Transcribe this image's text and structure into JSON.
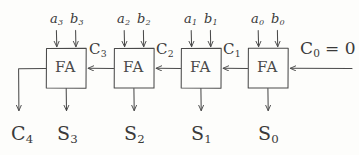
{
  "diagram": {
    "stroke_color": "#4a4a4a",
    "background_color": "#fdfdfb",
    "block_label": "FA",
    "blocks": [
      {
        "name": "fa-3",
        "label": "FA",
        "x": 46,
        "y": 48,
        "w": 40,
        "h": 40
      },
      {
        "name": "fa-2",
        "label": "FA",
        "x": 114,
        "y": 48,
        "w": 40,
        "h": 40
      },
      {
        "name": "fa-1",
        "label": "FA",
        "x": 181,
        "y": 48,
        "w": 40,
        "h": 40
      },
      {
        "name": "fa-0",
        "label": "FA",
        "x": 248,
        "y": 48,
        "w": 40,
        "h": 40
      }
    ],
    "inputs": [
      {
        "name": "input-a3",
        "letter": "a",
        "index": "3",
        "x": 50,
        "y": 12
      },
      {
        "name": "input-b3",
        "letter": "b",
        "index": "3",
        "x": 70,
        "y": 12
      },
      {
        "name": "input-a2",
        "letter": "a",
        "index": "2",
        "x": 117,
        "y": 12
      },
      {
        "name": "input-b2",
        "letter": "b",
        "index": "2",
        "x": 137,
        "y": 12
      },
      {
        "name": "input-a1",
        "letter": "a",
        "index": "1",
        "x": 184,
        "y": 12
      },
      {
        "name": "input-b1",
        "letter": "b",
        "index": "1",
        "x": 204,
        "y": 12
      },
      {
        "name": "input-a0",
        "letter": "a",
        "index": "0",
        "x": 251,
        "y": 12
      },
      {
        "name": "input-b0",
        "letter": "b",
        "index": "0",
        "x": 271,
        "y": 12
      }
    ],
    "carries": [
      {
        "name": "carry-c3",
        "letter": "C",
        "index": "3",
        "x": 89,
        "y": 42
      },
      {
        "name": "carry-c2",
        "letter": "C",
        "index": "2",
        "x": 156,
        "y": 42
      },
      {
        "name": "carry-c1",
        "letter": "C",
        "index": "1",
        "x": 223,
        "y": 42
      },
      {
        "name": "carry-c0",
        "letter": "C",
        "index": "0",
        "suffix": " = 0",
        "x": 300,
        "y": 40
      }
    ],
    "outputs": [
      {
        "name": "output-c4",
        "letter": "C",
        "index": "4",
        "x": 11,
        "y": 124
      },
      {
        "name": "output-s3",
        "letter": "S",
        "index": "3",
        "x": 57,
        "y": 124
      },
      {
        "name": "output-s2",
        "letter": "S",
        "index": "2",
        "x": 124,
        "y": 124
      },
      {
        "name": "output-s1",
        "letter": "S",
        "index": "1",
        "x": 191,
        "y": 124
      },
      {
        "name": "output-s0",
        "letter": "S",
        "index": "0",
        "x": 258,
        "y": 124
      }
    ]
  }
}
